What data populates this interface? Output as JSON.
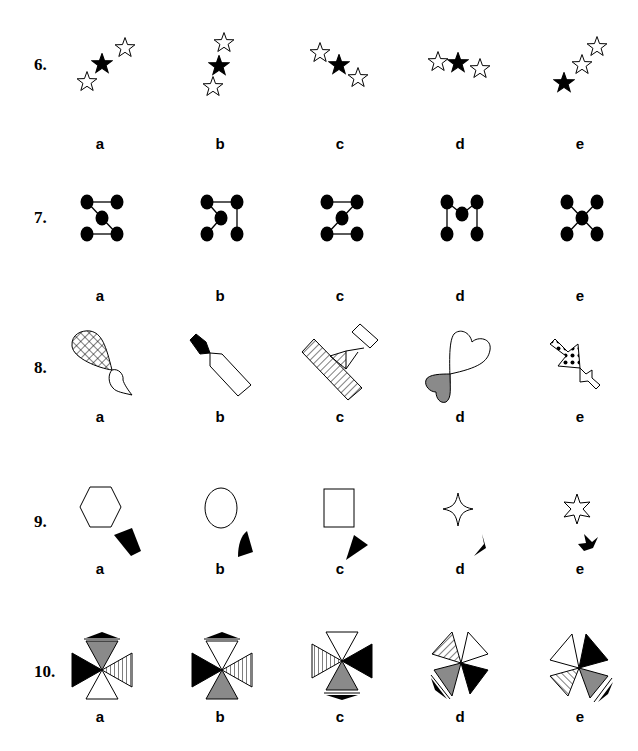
{
  "questions": [
    {
      "number": "6.",
      "options": [
        "a",
        "b",
        "c",
        "d",
        "e"
      ],
      "theme": "three stars (one black, two white) in varying arrangements"
    },
    {
      "number": "7.",
      "options": [
        "a",
        "b",
        "c",
        "d",
        "e"
      ],
      "theme": "five black dots connected by lines"
    },
    {
      "number": "8.",
      "options": [
        "a",
        "b",
        "c",
        "d",
        "e"
      ],
      "theme": "pairs of joined shapes with patterns"
    },
    {
      "number": "9.",
      "options": [
        "a",
        "b",
        "c",
        "d",
        "e"
      ],
      "theme": "outline shape with small black shape beneath"
    },
    {
      "number": "10.",
      "options": [
        "a",
        "b",
        "c",
        "d",
        "e"
      ],
      "theme": "four triangles meeting at a center point"
    }
  ],
  "colors": {
    "black": "#000000",
    "white": "#ffffff",
    "gray": "#8a8a8a"
  },
  "columns_x": [
    101,
    220,
    340,
    460,
    580
  ]
}
